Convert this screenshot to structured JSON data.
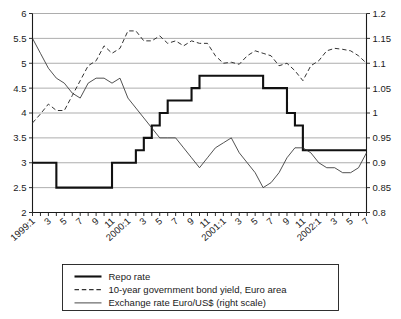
{
  "chart_data": {
    "type": "line",
    "title": "",
    "xlabel": "",
    "ylabel": "",
    "y2label": "",
    "grid": true,
    "legend_position": "bottom-center",
    "ylim": [
      2,
      6
    ],
    "y2lim": [
      0.8,
      1.2
    ],
    "yticks": [
      "2",
      "2.5",
      "3",
      "3.5",
      "4",
      "4.5",
      "5",
      "5.5",
      "6"
    ],
    "y2ticks": [
      "0.8",
      "0.85",
      "0.9",
      "0.95",
      "1",
      "1.05",
      "1.1",
      "1.15",
      "1.2"
    ],
    "x": [
      "1999:1",
      "1999:2",
      "1999:3",
      "1999:4",
      "1999:5",
      "1999:6",
      "1999:7",
      "1999:8",
      "1999:9",
      "1999:10",
      "1999:11",
      "1999:12",
      "2000:1",
      "2000:2",
      "2000:3",
      "2000:4",
      "2000:5",
      "2000:6",
      "2000:7",
      "2000:8",
      "2000:9",
      "2000:10",
      "2000:11",
      "2000:12",
      "2001:1",
      "2001:2",
      "2001:3",
      "2001:4",
      "2001:5",
      "2001:6",
      "2001:7",
      "2001:8",
      "2001:9",
      "2001:10",
      "2001:11",
      "2001:12",
      "2002:1",
      "2002:2",
      "2002:3",
      "2002:4",
      "2002:5",
      "2002:6",
      "2002:7"
    ],
    "xticklabels": [
      "1999:1",
      "3",
      "5",
      "7",
      "9",
      "11",
      "2000:1",
      "3",
      "5",
      "7",
      "9",
      "11",
      "2001:1",
      "3",
      "5",
      "7",
      "9",
      "11",
      "2002:1",
      "3",
      "5",
      "7"
    ],
    "series": [
      {
        "name": "Repo rate",
        "axis": "left",
        "style": "solid-thick",
        "values": [
          3.0,
          3.0,
          3.0,
          2.5,
          2.5,
          2.5,
          2.5,
          2.5,
          2.5,
          2.5,
          3.0,
          3.0,
          3.0,
          3.25,
          3.5,
          3.75,
          4.0,
          4.25,
          4.25,
          4.25,
          4.5,
          4.75,
          4.75,
          4.75,
          4.75,
          4.75,
          4.75,
          4.75,
          4.75,
          4.5,
          4.5,
          4.5,
          4.0,
          3.75,
          3.25,
          3.25,
          3.25,
          3.25,
          3.25,
          3.25,
          3.25,
          3.25,
          3.25
        ]
      },
      {
        "name": "10-year government bond yield, Euro area",
        "axis": "left",
        "style": "dashed",
        "values": [
          3.8,
          3.98,
          4.18,
          4.05,
          4.05,
          4.35,
          4.65,
          4.95,
          5.05,
          5.35,
          5.2,
          5.3,
          5.65,
          5.65,
          5.45,
          5.45,
          5.55,
          5.4,
          5.45,
          5.35,
          5.45,
          5.4,
          5.4,
          5.15,
          5.0,
          5.02,
          4.98,
          5.15,
          5.25,
          5.2,
          5.15,
          4.95,
          5.0,
          4.85,
          4.65,
          4.95,
          5.05,
          5.25,
          5.3,
          5.28,
          5.25,
          5.15,
          5.0
        ]
      },
      {
        "name": "Exchange rate Euro/US$ (right scale)",
        "axis": "right",
        "style": "solid-thin",
        "values": [
          1.15,
          1.12,
          1.09,
          1.07,
          1.06,
          1.04,
          1.03,
          1.06,
          1.07,
          1.07,
          1.06,
          1.07,
          1.03,
          1.01,
          0.99,
          0.97,
          0.95,
          0.95,
          0.95,
          0.93,
          0.91,
          0.89,
          0.91,
          0.93,
          0.94,
          0.95,
          0.92,
          0.9,
          0.88,
          0.85,
          0.86,
          0.88,
          0.91,
          0.93,
          0.93,
          0.92,
          0.9,
          0.89,
          0.89,
          0.88,
          0.88,
          0.89,
          0.92
        ]
      }
    ],
    "legend": [
      "Repo rate",
      "10-year government bond yield, Euro area",
      "Exchange rate Euro/US$ (right scale)"
    ]
  },
  "colors": {
    "repo": "#111111",
    "bond": "#333333",
    "fx": "#333333",
    "grid": "#8a8a8a",
    "axis": "#1a1a1a",
    "background": "#ffffff"
  }
}
